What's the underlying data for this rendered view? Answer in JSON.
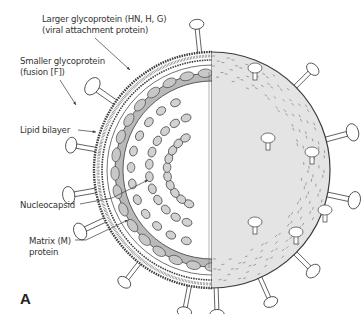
{
  "figure": {
    "panel_label": "A",
    "labels": [
      {
        "id": "larger-glycoprotein",
        "lines": [
          "Larger glycoprotein (HN, H, G)",
          "(viral attachment protein)"
        ]
      },
      {
        "id": "smaller-glycoprotein",
        "lines": [
          "Smaller glycoprotein",
          "(fusion [F])"
        ]
      },
      {
        "id": "lipid-bilayer",
        "lines": [
          "Lipid bilayer"
        ]
      },
      {
        "id": "nucleocapsid",
        "lines": [
          "Nucleocapsid"
        ]
      },
      {
        "id": "matrix-protein",
        "lines": [
          "Matrix (M)",
          "protein"
        ]
      }
    ],
    "colors": {
      "line": "#3a3a3a",
      "surface": "#e4e4e4",
      "matrix_fill": "#b9b9b9",
      "capsomer_fill": "#d2d2d2",
      "spike_fill": "#ffffff"
    }
  }
}
